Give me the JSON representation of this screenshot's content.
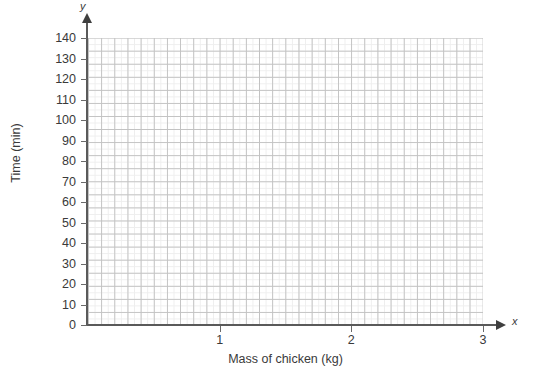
{
  "chart_data": {
    "type": "scatter",
    "title": "",
    "subtitle": "",
    "xlabel": "Mass of chicken (kg)",
    "ylabel": "Time (min)",
    "x_axis_variable": "x",
    "y_axis_variable": "y",
    "xlim": [
      0,
      3
    ],
    "ylim": [
      0,
      140
    ],
    "x_tick_labels": [
      "1",
      "2",
      "3"
    ],
    "x_tick_values": [
      1,
      2,
      3
    ],
    "y_tick_labels": [
      "0",
      "10",
      "20",
      "30",
      "40",
      "50",
      "60",
      "70",
      "80",
      "90",
      "100",
      "110",
      "120",
      "130",
      "140"
    ],
    "y_tick_values": [
      0,
      10,
      20,
      30,
      40,
      50,
      60,
      70,
      80,
      90,
      100,
      110,
      120,
      130,
      140
    ],
    "x_major_step": 0.1,
    "y_major_step": 10,
    "x_minor_step": 0.05,
    "y_minor_step": 5,
    "grid": true,
    "grid_style": "graph-paper",
    "legend": false,
    "legend_position": "none",
    "series": [],
    "values": [],
    "annotations": [],
    "colors": {
      "axis": "#5a5a5a",
      "arrow": "#3f3f3f",
      "grid_major": "#c2c2c2",
      "grid_minor": "#eeeeee",
      "text": "#3a3a3a",
      "background": "#ffffff"
    }
  }
}
